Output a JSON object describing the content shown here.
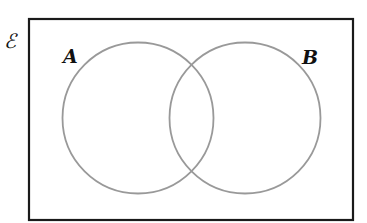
{
  "diagram": {
    "type": "venn",
    "universal_set": {
      "label": "ℰ",
      "rect": {
        "x": 28,
        "y": 18,
        "width": 326,
        "height": 203
      },
      "stroke": "#1a1a1a"
    },
    "sets": [
      {
        "label": "A",
        "cx": 138,
        "cy": 118,
        "r": 76,
        "stroke": "#999999"
      },
      {
        "label": "B",
        "cx": 245,
        "cy": 118,
        "r": 76,
        "stroke": "#999999"
      }
    ]
  }
}
